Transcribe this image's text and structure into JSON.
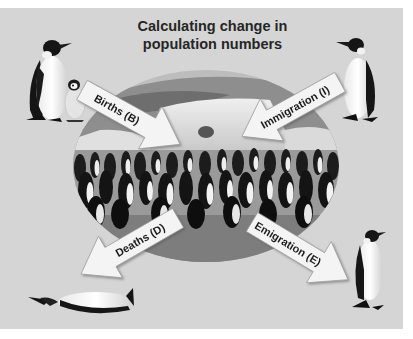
{
  "title": {
    "line1": "Calculating change in",
    "line2": "population numbers"
  },
  "center_image": {
    "description": "Oval photograph of an emperor penguin colony on ice with an iceberg behind"
  },
  "arrows": [
    {
      "id": "births",
      "label": "Births (B)",
      "direction": "inward",
      "source": "adult penguin with chick"
    },
    {
      "id": "immigration",
      "label": "Immigration (I)",
      "direction": "inward",
      "source": "single adult penguin"
    },
    {
      "id": "deaths",
      "label": "Deaths (D)",
      "direction": "outward",
      "target": "dead penguin lying down"
    },
    {
      "id": "emigration",
      "label": "Emigration (E)",
      "direction": "outward",
      "target": "single adult penguin walking away"
    }
  ],
  "colors": {
    "background": "#d5d5d5",
    "arrow_fill": "#f4f4f4",
    "arrow_stroke": "#9a9a9a",
    "text": "#1e1e1e"
  }
}
